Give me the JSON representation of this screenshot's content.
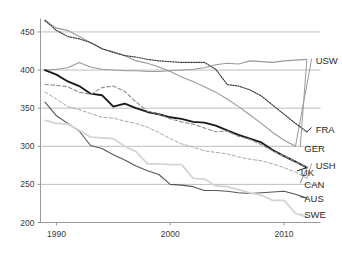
{
  "chart_data": {
    "type": "line",
    "title": "",
    "subtitle": "",
    "xlabel": "",
    "ylabel": "",
    "xlim": [
      1988.6,
      2013.2
    ],
    "ylim": [
      200,
      465
    ],
    "grid": true,
    "gridlines_y": [
      250,
      300,
      350,
      400,
      450
    ],
    "x_ticks": [
      1990,
      2000,
      2010
    ],
    "x_tick_labels": [
      "1990",
      "2000",
      "2010"
    ],
    "y_ticks": [
      200,
      250,
      300,
      350,
      400,
      450
    ],
    "y_tick_labels": [
      "200",
      "250",
      "300",
      "350",
      "400",
      "450"
    ],
    "legend_position": "right-inline-end-labels",
    "x": [
      1989,
      1990,
      1991,
      1992,
      1993,
      1994,
      1995,
      1996,
      1997,
      1998,
      1999,
      2000,
      2001,
      2002,
      2003,
      2004,
      2005,
      2006,
      2007,
      2008,
      2009,
      2010,
      2011,
      2012
    ],
    "series": [
      {
        "name": "USW",
        "label": "USW",
        "color": "#9a9a9a",
        "style": "solid",
        "width": 1.1,
        "label_y": 412,
        "label_x": 2012.6,
        "values": [
          465,
          455,
          452,
          444,
          436,
          428,
          424,
          419,
          412,
          409,
          404,
          398,
          391,
          385,
          378,
          371,
          362,
          352,
          341,
          330,
          318,
          308,
          300,
          null
        ]
      },
      {
        "name": "FRA",
        "label": "FRA",
        "color": "#3a3a3a",
        "style": "dotted",
        "width": 1.2,
        "label_y": 322,
        "label_x": 2012.6,
        "values": [
          465,
          452,
          444,
          441,
          436,
          428,
          423,
          419,
          417,
          414,
          412,
          411,
          410,
          410,
          410,
          401,
          381,
          379,
          374,
          366,
          354,
          342,
          330,
          319
        ]
      },
      {
        "name": "GER",
        "label": "GER",
        "color": "#9a9a9a",
        "style": "solid",
        "width": 1.1,
        "label_y": 297,
        "label_x": 2011.6,
        "values": [
          400,
          401,
          403,
          410,
          404,
          401,
          400,
          399,
          399,
          398,
          398,
          399,
          400,
          401,
          403,
          407,
          409,
          408,
          412,
          411,
          410,
          412,
          413,
          414
        ]
      },
      {
        "name": "USH",
        "label": "USH",
        "color": "#a8a8a8",
        "style": "dashed",
        "width": 1.0,
        "label_y": 275,
        "label_x": 2012.6,
        "values": [
          371,
          362,
          352,
          348,
          343,
          338,
          337,
          333,
          330,
          325,
          318,
          310,
          303,
          299,
          294,
          292,
          290,
          286,
          283,
          281,
          277,
          272,
          266,
          258
        ]
      },
      {
        "name": "UK",
        "label": "UK",
        "color": "#1a1a1a",
        "style": "solid",
        "width": 1.9,
        "label_y": 265,
        "label_x": 2011.3,
        "values": [
          400,
          394,
          385,
          379,
          369,
          367,
          352,
          356,
          350,
          345,
          342,
          338,
          336,
          332,
          331,
          327,
          321,
          315,
          310,
          305,
          295,
          287,
          280,
          272
        ]
      },
      {
        "name": "CAN",
        "label": "CAN",
        "color": "#8c8c8c",
        "style": "dashed",
        "width": 1.1,
        "label_y": 249,
        "label_x": 2011.6,
        "values": [
          381,
          380,
          378,
          371,
          368,
          377,
          379,
          372,
          358,
          346,
          342,
          336,
          332,
          329,
          324,
          319,
          320,
          313,
          309,
          302,
          294,
          287,
          280,
          272
        ]
      },
      {
        "name": "AUS",
        "label": "AUS",
        "color": "#555555",
        "style": "solid",
        "width": 1.1,
        "label_y": 231,
        "label_x": 2011.6,
        "values": [
          358,
          340,
          330,
          320,
          301,
          297,
          289,
          282,
          274,
          268,
          263,
          250,
          249,
          247,
          242,
          242,
          241,
          239,
          238,
          239,
          240,
          241,
          237,
          232
        ]
      },
      {
        "name": "SWE",
        "label": "SWE",
        "color": "#d4d4d4",
        "style": "solid",
        "width": 1.8,
        "label_y": 210,
        "label_x": 2011.6,
        "values": [
          334,
          330,
          329,
          321,
          312,
          311,
          310,
          300,
          293,
          277,
          277,
          276,
          276,
          258,
          257,
          248,
          247,
          243,
          239,
          236,
          229,
          229,
          212,
          207
        ]
      }
    ]
  },
  "axis": {
    "axis_color": "#9a9a9a",
    "grid_color": "#b8b8b8",
    "background": "#ffffff"
  }
}
